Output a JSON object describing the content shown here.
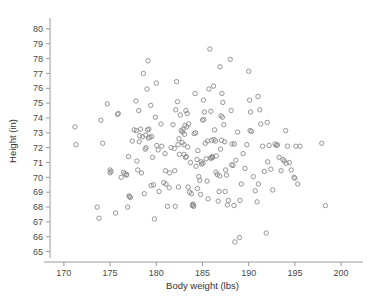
{
  "figure": {
    "name": "scatter-plot-height-vs-body-weight",
    "background": "#ffffff",
    "marker_color": "#8a8a8a",
    "axis_color": "#9a9a9a",
    "text_color": "#4a4a4a",
    "caption_fragment": ""
  },
  "chart_data": {
    "type": "scatter",
    "title": "",
    "xlabel": "Body weight (lbs)",
    "ylabel": "Height (in)",
    "xlim": [
      168.5,
      201.5
    ],
    "ylim": [
      64.3,
      80.6
    ],
    "xticks": [
      170,
      175,
      180,
      185,
      190,
      195,
      200
    ],
    "xtick_labels": [
      "170",
      "175",
      "180",
      "185",
      "190",
      "195",
      "200"
    ],
    "yticks": [
      65,
      66,
      67,
      68,
      69,
      70,
      71,
      72,
      73,
      74,
      75,
      76,
      77,
      78,
      79,
      80
    ],
    "ytick_labels": [
      "65",
      "66",
      "67",
      "68",
      "69",
      "70",
      "71",
      "72",
      "73",
      "74",
      "75",
      "76",
      "77",
      "78",
      "79",
      "80"
    ],
    "grid": false,
    "legend": false,
    "marker": "open-circle",
    "marker_size": 4.4,
    "n_points": 203,
    "points": [
      [
        171.2,
        73.4
      ],
      [
        171.3,
        72.2
      ],
      [
        173.6,
        68.0
      ],
      [
        173.8,
        67.25
      ],
      [
        174.0,
        73.85
      ],
      [
        174.2,
        72.3
      ],
      [
        174.7,
        74.95
      ],
      [
        175.0,
        70.5
      ],
      [
        175.0,
        70.3
      ],
      [
        175.6,
        67.6
      ],
      [
        175.8,
        74.25
      ],
      [
        175.9,
        74.3
      ],
      [
        176.2,
        70.0
      ],
      [
        176.6,
        70.25
      ],
      [
        176.8,
        70.2
      ],
      [
        176.9,
        68.0
      ],
      [
        177.0,
        71.4
      ],
      [
        177.1,
        68.7
      ],
      [
        177.2,
        68.65
      ],
      [
        177.4,
        72.45
      ],
      [
        177.6,
        73.2
      ],
      [
        177.8,
        75.15
      ],
      [
        177.9,
        71.1
      ],
      [
        178.0,
        70.5
      ],
      [
        178.1,
        74.5
      ],
      [
        178.2,
        72.8
      ],
      [
        178.3,
        73.25
      ],
      [
        178.4,
        70.3
      ],
      [
        178.5,
        72.75
      ],
      [
        178.6,
        77.0
      ],
      [
        178.7,
        68.9
      ],
      [
        178.8,
        71.9
      ],
      [
        178.9,
        72.0
      ],
      [
        179.0,
        75.95
      ],
      [
        179.1,
        77.85
      ],
      [
        179.2,
        73.25
      ],
      [
        179.3,
        72.7
      ],
      [
        179.4,
        74.85
      ],
      [
        179.5,
        72.75
      ],
      [
        179.6,
        71.35
      ],
      [
        179.7,
        69.5
      ],
      [
        179.8,
        67.2
      ],
      [
        179.9,
        74.05
      ],
      [
        180.0,
        76.35
      ],
      [
        180.2,
        71.85
      ],
      [
        180.3,
        69.05
      ],
      [
        180.5,
        73.6
      ],
      [
        180.6,
        72.1
      ],
      [
        180.8,
        69.65
      ],
      [
        181.0,
        70.45
      ],
      [
        181.2,
        68.05
      ],
      [
        181.4,
        69.3
      ],
      [
        181.6,
        72.0
      ],
      [
        181.8,
        73.55
      ],
      [
        182.0,
        70.45
      ],
      [
        182.1,
        74.55
      ],
      [
        182.2,
        76.45
      ],
      [
        182.3,
        75.1
      ],
      [
        182.4,
        69.35
      ],
      [
        182.5,
        71.55
      ],
      [
        182.6,
        74.2
      ],
      [
        182.7,
        73.15
      ],
      [
        182.8,
        72.35
      ],
      [
        182.9,
        73.25
      ],
      [
        183.0,
        72.2
      ],
      [
        183.0,
        71.55
      ],
      [
        183.1,
        73.5
      ],
      [
        183.2,
        74.5
      ],
      [
        183.3,
        73.4
      ],
      [
        183.4,
        72.05
      ],
      [
        183.5,
        73.6
      ],
      [
        183.6,
        69.0
      ],
      [
        183.7,
        71.0
      ],
      [
        183.8,
        68.9
      ],
      [
        183.9,
        68.1
      ],
      [
        184.0,
        68.15
      ],
      [
        184.1,
        72.95
      ],
      [
        184.2,
        75.65
      ],
      [
        184.3,
        70.75
      ],
      [
        184.4,
        71.2
      ],
      [
        184.5,
        71.8
      ],
      [
        184.6,
        70.05
      ],
      [
        184.7,
        69.8
      ],
      [
        184.8,
        68.85
      ],
      [
        184.9,
        70.9
      ],
      [
        185.0,
        73.85
      ],
      [
        185.1,
        75.2
      ],
      [
        185.2,
        74.4
      ],
      [
        185.3,
        72.3
      ],
      [
        185.4,
        71.25
      ],
      [
        185.5,
        69.75
      ],
      [
        185.6,
        68.55
      ],
      [
        185.7,
        75.95
      ],
      [
        185.8,
        78.65
      ],
      [
        185.9,
        74.45
      ],
      [
        186.0,
        72.5
      ],
      [
        186.0,
        71.3
      ],
      [
        186.1,
        71.35
      ],
      [
        186.2,
        76.15
      ],
      [
        186.3,
        73.2
      ],
      [
        186.4,
        72.45
      ],
      [
        186.5,
        71.45
      ],
      [
        186.6,
        70.2
      ],
      [
        186.7,
        68.4
      ],
      [
        186.8,
        69.05
      ],
      [
        186.9,
        77.45
      ],
      [
        187.0,
        74.15
      ],
      [
        187.1,
        75.65
      ],
      [
        187.2,
        75.05
      ],
      [
        187.3,
        73.55
      ],
      [
        187.4,
        72.4
      ],
      [
        187.5,
        70.5
      ],
      [
        187.6,
        70.15
      ],
      [
        187.7,
        68.15
      ],
      [
        187.8,
        68.45
      ],
      [
        188.0,
        77.95
      ],
      [
        188.1,
        74.5
      ],
      [
        188.2,
        72.25
      ],
      [
        188.3,
        70.8
      ],
      [
        188.4,
        68.1
      ],
      [
        188.5,
        65.65
      ],
      [
        188.6,
        71.15
      ],
      [
        188.8,
        73.05
      ],
      [
        189.0,
        65.95
      ],
      [
        189.2,
        69.55
      ],
      [
        189.4,
        71.6
      ],
      [
        189.6,
        70.6
      ],
      [
        189.8,
        72.2
      ],
      [
        190.0,
        77.15
      ],
      [
        190.1,
        75.2
      ],
      [
        190.2,
        74.4
      ],
      [
        190.3,
        73.1
      ],
      [
        190.5,
        70.05
      ],
      [
        190.7,
        69.1
      ],
      [
        190.9,
        68.35
      ],
      [
        191.0,
        75.45
      ],
      [
        191.2,
        74.55
      ],
      [
        191.3,
        73.6
      ],
      [
        191.5,
        72.1
      ],
      [
        191.7,
        70.4
      ],
      [
        191.9,
        66.25
      ],
      [
        192.0,
        73.7
      ],
      [
        192.2,
        72.15
      ],
      [
        192.4,
        70.55
      ],
      [
        192.6,
        69.15
      ],
      [
        193.0,
        72.15
      ],
      [
        193.1,
        72.2
      ],
      [
        193.3,
        71.35
      ],
      [
        193.5,
        70.45
      ],
      [
        193.7,
        71.2
      ],
      [
        194.0,
        73.15
      ],
      [
        194.2,
        72.1
      ],
      [
        194.4,
        71.0
      ],
      [
        194.6,
        70.5
      ],
      [
        194.9,
        70.0
      ],
      [
        195.0,
        69.95
      ],
      [
        195.1,
        72.1
      ],
      [
        195.3,
        69.55
      ],
      [
        198.3,
        68.1
      ],
      [
        197.9,
        72.3
      ],
      [
        182.35,
        72.2
      ],
      [
        183.15,
        71.35
      ],
      [
        183.25,
        71.4
      ],
      [
        185.85,
        71.3
      ],
      [
        186.05,
        71.4
      ],
      [
        184.05,
        68.05
      ],
      [
        183.95,
        68.2
      ],
      [
        179.15,
        72.65
      ],
      [
        178.85,
        72.85
      ],
      [
        175.1,
        70.4
      ],
      [
        176.75,
        70.15
      ],
      [
        177.05,
        68.75
      ],
      [
        186.45,
        70.35
      ],
      [
        186.85,
        70.1
      ],
      [
        187.15,
        74.05
      ],
      [
        185.55,
        72.45
      ],
      [
        182.85,
        73.05
      ],
      [
        183.05,
        72.9
      ],
      [
        181.95,
        71.95
      ],
      [
        180.95,
        71.6
      ],
      [
        184.85,
        71.05
      ],
      [
        188.15,
        70.85
      ],
      [
        192.85,
        72.25
      ],
      [
        193.85,
        71.1
      ],
      [
        176.45,
        70.35
      ],
      [
        179.05,
        73.2
      ],
      [
        185.15,
        73.9
      ],
      [
        186.25,
        72.55
      ],
      [
        187.05,
        72.5
      ],
      [
        184.45,
        69.25
      ],
      [
        183.45,
        69.35
      ],
      [
        182.05,
        68.05
      ],
      [
        181.05,
        69.55
      ],
      [
        178.15,
        72.4
      ],
      [
        190.15,
        73.15
      ],
      [
        189.05,
        68.45
      ],
      [
        191.05,
        69.55
      ],
      [
        195.55,
        72.1
      ],
      [
        194.05,
        70.95
      ],
      [
        192.05,
        71.05
      ],
      [
        180.05,
        72.15
      ],
      [
        177.85,
        73.15
      ],
      [
        185.05,
        70.95
      ],
      [
        186.95,
        71.9
      ],
      [
        188.45,
        72.25
      ],
      [
        184.25,
        73.0
      ],
      [
        183.35,
        74.3
      ],
      [
        182.45,
        72.6
      ],
      [
        181.45,
        70.3
      ],
      [
        179.45,
        69.45
      ],
      [
        187.45,
        69.05
      ]
    ]
  }
}
